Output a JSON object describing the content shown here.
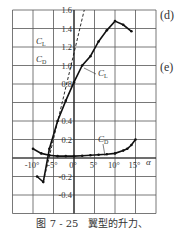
{
  "chart_data": {
    "type": "line",
    "title": "",
    "xlabel": "α",
    "ylabel": "C_L / C_D",
    "xlim": [
      -15,
      20
    ],
    "ylim": [
      -0.6,
      1.6
    ],
    "grid": true,
    "x_tick_labels": [
      "-10°",
      "-5°",
      "0°",
      "5°",
      "10°",
      "15°"
    ],
    "y_tick_labels": [
      "1.6",
      "1.4",
      "1.2",
      "1.0",
      "0.8",
      "0.4",
      "0.2",
      "-0.2",
      "-0.4"
    ],
    "legend": [
      "C_L",
      "C_D"
    ],
    "series": [
      {
        "name": "C_L",
        "style": "solid",
        "x": [
          -9,
          -7.5,
          -6,
          -4,
          -2,
          0,
          2,
          4,
          6,
          8,
          10,
          12,
          14
        ],
        "y": [
          -0.2,
          -0.26,
          0.1,
          0.4,
          0.62,
          0.82,
          1.0,
          1.1,
          1.26,
          1.38,
          1.48,
          1.44,
          1.37
        ]
      },
      {
        "name": "C_L (theory, dashed)",
        "style": "dashed",
        "x": [
          -7.5,
          2.5
        ],
        "y": [
          -0.26,
          1.6
        ]
      },
      {
        "name": "C_D",
        "style": "solid",
        "x": [
          -10,
          -8,
          -6,
          -4,
          -2,
          0,
          2,
          4,
          6,
          8,
          10,
          12,
          13,
          14,
          15
        ],
        "y": [
          0.1,
          0.05,
          0.03,
          0.02,
          0.02,
          0.02,
          0.025,
          0.03,
          0.035,
          0.04,
          0.05,
          0.08,
          0.1,
          0.14,
          0.2
        ]
      }
    ],
    "annotations": [
      "C_L",
      "C_D"
    ]
  },
  "labels": {
    "legend_cl": "C",
    "legend_cl_sub": "L",
    "legend_cd": "C",
    "legend_cd_sub": "D",
    "alpha": "α"
  },
  "side_labels": [
    "(d)",
    "(e)"
  ],
  "caption": "图 7 - 25　翼型的升力、"
}
